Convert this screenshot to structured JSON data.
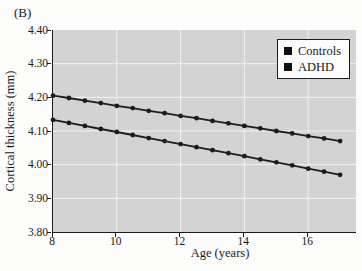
{
  "panel_label": "(B)",
  "colors": {
    "page_background": "#fcfcfa",
    "plot_background": "#d3d3d3",
    "grid": "#f2f2f2",
    "axis": "#1c1c1c",
    "series": "#1c1c1c",
    "legend_background": "#fdfdfd"
  },
  "chart_data": {
    "type": "line",
    "title": "",
    "xlabel": "Age (years)",
    "ylabel": "Cortical thickness (mm)",
    "xlim": [
      8,
      17.5
    ],
    "ylim": [
      3.8,
      4.4
    ],
    "x_ticks": [
      8,
      10,
      12,
      14,
      16
    ],
    "y_ticks": [
      "4.40",
      "4.30",
      "4.20",
      "4.10",
      "4.00",
      "3.90",
      "3.80"
    ],
    "grid": true,
    "legend_position": "top-right",
    "x": [
      8,
      8.5,
      9,
      9.5,
      10,
      10.5,
      11,
      11.5,
      12,
      12.5,
      13,
      13.5,
      14,
      14.5,
      15,
      15.5,
      16,
      16.5,
      17
    ],
    "series": [
      {
        "name": "Controls",
        "color": "#1c1c1c",
        "marker": "circle",
        "values": [
          4.205,
          4.198,
          4.19,
          4.183,
          4.175,
          4.168,
          4.16,
          4.153,
          4.145,
          4.138,
          4.13,
          4.123,
          4.115,
          4.108,
          4.1,
          4.093,
          4.085,
          4.078,
          4.07
        ]
      },
      {
        "name": "ADHD",
        "color": "#1c1c1c",
        "marker": "circle",
        "values": [
          4.133,
          4.124,
          4.115,
          4.106,
          4.097,
          4.088,
          4.079,
          4.07,
          4.061,
          4.052,
          4.043,
          4.034,
          4.025,
          4.016,
          4.007,
          3.998,
          3.988,
          3.979,
          3.97
        ]
      }
    ]
  }
}
